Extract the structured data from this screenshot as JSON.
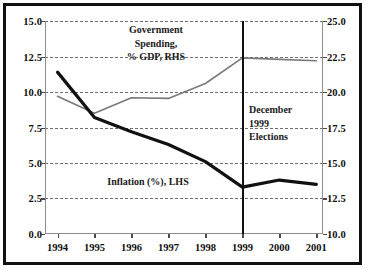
{
  "chart_data": {
    "type": "line",
    "title": "",
    "subtitle": "",
    "xlabel": "",
    "categories": [
      "1994",
      "1995",
      "1996",
      "1997",
      "1998",
      "1999",
      "2000",
      "2001"
    ],
    "x": [
      1994,
      1995,
      1996,
      1997,
      1998,
      1999,
      2000,
      2001
    ],
    "grid": true,
    "legend_position": "inline-annotations",
    "axes": {
      "left": {
        "label": "Inflation (%), LHS",
        "ylim": [
          0.0,
          15.0
        ],
        "ticks": [
          0.0,
          2.5,
          5.0,
          7.5,
          10.0,
          12.5,
          15.0
        ],
        "ticklabels": [
          "0.0",
          "2.5",
          "5.0",
          "7.5",
          "10.0",
          "12.5",
          "15.0"
        ]
      },
      "right": {
        "label": "Government Spending, % GDP, RHS",
        "ylim": [
          10.0,
          25.0
        ],
        "ticks": [
          10.0,
          12.5,
          15.0,
          17.5,
          20.0,
          22.5,
          25.0
        ],
        "ticklabels": [
          "10.0",
          "12.5",
          "15.0",
          "17.5",
          "20.0",
          "22.5",
          "25.0"
        ]
      }
    },
    "series": [
      {
        "name": "Inflation (%), LHS",
        "axis": "left",
        "color": "#111111",
        "linewidth": 3.2,
        "values": [
          11.4,
          8.2,
          7.2,
          6.3,
          5.1,
          3.3,
          3.8,
          3.5
        ]
      },
      {
        "name": "Government Spending, % GDP, RHS",
        "axis": "right",
        "color": "#7a7a7a",
        "linewidth": 1.6,
        "values": [
          19.7,
          18.5,
          19.6,
          19.55,
          20.6,
          22.4,
          22.3,
          22.2
        ]
      }
    ],
    "annotations": [
      {
        "name": "government-spending-label",
        "text": "Government\nSpending,\n% GDP, RHS",
        "x": 1996.0,
        "y_right": 24.1
      },
      {
        "name": "december-elections-label",
        "text": "December\n1999\nElections",
        "x": 1999.2,
        "y_right": 18.7
      },
      {
        "name": "inflation-label",
        "text": "Inflation (%), LHS",
        "x": 1996.2,
        "y_left": 4.2
      }
    ],
    "vlines": [
      {
        "name": "december-1999-election-line",
        "x": 1999,
        "color": "#111111",
        "width": 2
      }
    ],
    "colors": {
      "inflation_line": "#111111",
      "spending_line": "#7a7a7a",
      "grid": "#6f6f6f",
      "axis": "#8d8d8d",
      "border": "#111111",
      "background": "#ffffff",
      "text": "#101010"
    }
  }
}
